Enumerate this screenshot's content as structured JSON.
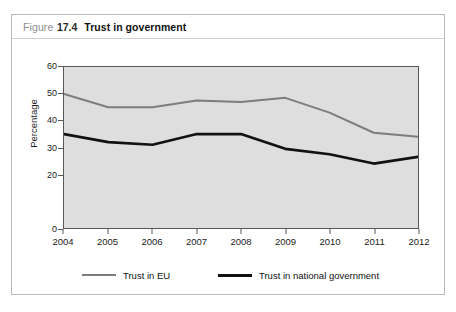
{
  "figure": {
    "label_word": "Figure",
    "number": "17.4",
    "title": "Trust in government"
  },
  "chart_data": {
    "type": "line",
    "title": "Trust in government",
    "xlabel": "",
    "ylabel": "Percentage",
    "x": [
      2004,
      2005,
      2006,
      2007,
      2008,
      2009,
      2010,
      2011,
      2012
    ],
    "categories": [
      "2004",
      "2005",
      "2006",
      "2007",
      "2008",
      "2009",
      "2010",
      "2011",
      "2012"
    ],
    "series": [
      {
        "name": "Trust in EU",
        "color": "#7d7d7d",
        "values": [
          50,
          45,
          45,
          47.5,
          47,
          48.5,
          43,
          35.5,
          34
        ]
      },
      {
        "name": "Trust in national government",
        "color": "#111111",
        "values": [
          35,
          32,
          31,
          35,
          35,
          29.5,
          27.5,
          24,
          26.5
        ]
      }
    ],
    "ylim": [
      0,
      60
    ],
    "xlim": [
      2004,
      2012
    ],
    "yticks": [
      0,
      20,
      30,
      40,
      50,
      60
    ],
    "ytick_labels": [
      "0",
      "20",
      "30",
      "40",
      "50",
      "60"
    ],
    "grid": false,
    "legend_position": "bottom-left",
    "plot_background": "#dedede",
    "axis_color": "#58585a"
  }
}
